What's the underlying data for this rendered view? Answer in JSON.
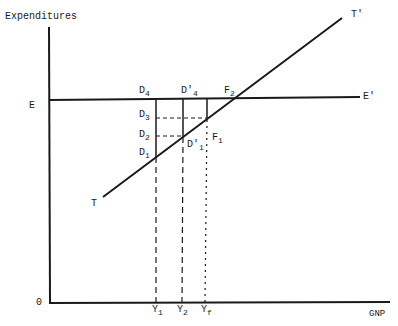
{
  "axes": {
    "y_label": "Expenditures",
    "x_label": "GNP",
    "origin_label": "0",
    "y_tick_label": "E"
  },
  "lines": {
    "expenditure_line": {
      "start_label": "E",
      "end_label": "E'"
    },
    "tax_line": {
      "start_label": "T",
      "end_label": "T'"
    }
  },
  "points": {
    "D4": {
      "base": "D",
      "sub": "4"
    },
    "D4_prime": {
      "base": "D'",
      "sub": "4"
    },
    "F2": {
      "base": "F",
      "sub": "2"
    },
    "D3": {
      "base": "D",
      "sub": "3"
    },
    "D2": {
      "base": "D",
      "sub": "2"
    },
    "D1": {
      "base": "D",
      "sub": "1"
    },
    "D1_prime": {
      "base": "D'",
      "sub": "1"
    },
    "F1": {
      "base": "F",
      "sub": "1"
    }
  },
  "x_ticks": {
    "Y1": {
      "base": "Y",
      "sub": "1"
    },
    "Y2": {
      "base": "Y",
      "sub": "2"
    },
    "Yf": {
      "base": "Y",
      "sub": "f"
    }
  },
  "colors": {
    "ink": "#1a1a1a",
    "background": "#ffffff"
  }
}
